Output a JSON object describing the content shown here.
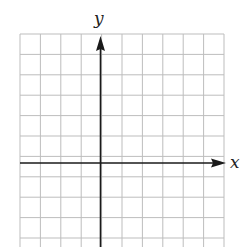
{
  "diagram": {
    "type": "coordinate-grid",
    "axes": {
      "x_label": "x",
      "y_label": "y"
    },
    "grid": {
      "columns": 10,
      "rows_visible": 10,
      "cell_size_px": 20.4,
      "origin_column": 4,
      "origin_row": 6,
      "grid_color": "#bdbdbd",
      "axis_color": "#1a1a1a"
    }
  }
}
